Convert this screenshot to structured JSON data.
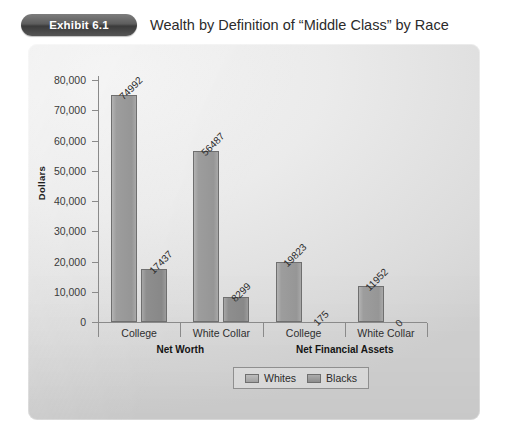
{
  "header": {
    "badge": "Exhibit 6.1",
    "title": "Wealth by Definition of “Middle Class” by Race"
  },
  "legend": {
    "items": [
      {
        "label": "Whites",
        "color": "#9d9d9d"
      },
      {
        "label": "Blacks",
        "color": "#8e8e8e"
      }
    ]
  },
  "chart_data": {
    "type": "bar",
    "title": "Wealth by Definition of “Middle Class” by Race",
    "xlabel": "",
    "ylabel": "Dollars",
    "ylim": [
      0,
      80000
    ],
    "yticks": [
      "0",
      "10,000",
      "20,000",
      "30,000",
      "40,000",
      "50,000",
      "60,000",
      "70,000",
      "80,000"
    ],
    "ytick_values": [
      0,
      10000,
      20000,
      30000,
      40000,
      50000,
      60000,
      70000,
      80000
    ],
    "grid": false,
    "legend_position": "bottom",
    "categories": [
      "College",
      "White Collar",
      "College",
      "White Collar"
    ],
    "group_labels": [
      "Net Worth",
      "Net Financial Assets"
    ],
    "groups": [
      {
        "name": "Net Worth",
        "categories": [
          "College",
          "White Collar"
        ]
      },
      {
        "name": "Net Financial Assets",
        "categories": [
          "College",
          "White Collar"
        ]
      }
    ],
    "series": [
      {
        "name": "Whites",
        "values": [
          74992,
          56487,
          19823,
          11952
        ]
      },
      {
        "name": "Blacks",
        "values": [
          17437,
          8299,
          175,
          0
        ]
      }
    ],
    "data_labels": [
      {
        "series": "Whites",
        "category": "Net Worth / College",
        "value": 74992,
        "text": "74992"
      },
      {
        "series": "Blacks",
        "category": "Net Worth / College",
        "value": 17437,
        "text": "17437"
      },
      {
        "series": "Whites",
        "category": "Net Worth / White Collar",
        "value": 56487,
        "text": "56487"
      },
      {
        "series": "Blacks",
        "category": "Net Worth / White Collar",
        "value": 8299,
        "text": "8299"
      },
      {
        "series": "Whites",
        "category": "Net Financial Assets / College",
        "value": 19823,
        "text": "19823"
      },
      {
        "series": "Blacks",
        "category": "Net Financial Assets / College",
        "value": 175,
        "text": "175"
      },
      {
        "series": "Whites",
        "category": "Net Financial Assets / White Collar",
        "value": 11952,
        "text": "11952"
      },
      {
        "series": "Blacks",
        "category": "Net Financial Assets / White Collar",
        "value": 0,
        "text": "0"
      }
    ]
  }
}
